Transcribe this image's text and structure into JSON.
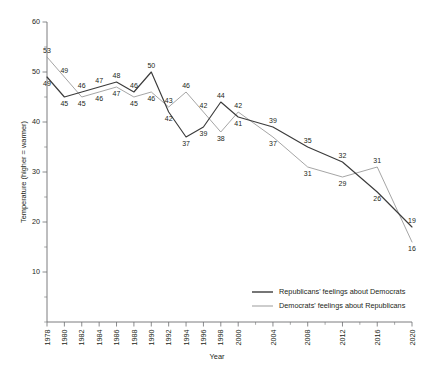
{
  "chart_data": {
    "type": "line",
    "title": "",
    "xlabel": "Year",
    "ylabel": "Temperature (higher = warmer)",
    "ylim": [
      0,
      60
    ],
    "xlim": [
      1978,
      2020
    ],
    "grid": false,
    "legend_position": "bottom-right",
    "y_ticks": [
      10,
      20,
      30,
      40,
      50,
      60
    ],
    "x_ticks": [
      1978,
      1980,
      1982,
      1984,
      1986,
      1988,
      1990,
      1992,
      1994,
      1996,
      1998,
      2000,
      2004,
      2008,
      2012,
      2016,
      2020
    ],
    "x_ticks_all": [
      1978,
      1980,
      1982,
      1984,
      1986,
      1988,
      1990,
      1992,
      1994,
      1996,
      1998,
      2000,
      2002,
      2004,
      2006,
      2008,
      2010,
      2012,
      2014,
      2016,
      2018,
      2020
    ],
    "series": [
      {
        "name": "Republicans' feelings about Democrats",
        "color": "#3b3b3b",
        "x": [
          1978,
          1980,
          1982,
          1984,
          1986,
          1988,
          1990,
          1992,
          1994,
          1996,
          1998,
          2000,
          2004,
          2008,
          2012,
          2016,
          2020
        ],
        "values": [
          49,
          45,
          46,
          47,
          48,
          46,
          50,
          42,
          37,
          39,
          44,
          41,
          39,
          35,
          32,
          26,
          19
        ]
      },
      {
        "name": "Democrats' feelings about Republicans",
        "color": "#9b9b9b",
        "x": [
          1978,
          1980,
          1982,
          1984,
          1986,
          1988,
          1990,
          1992,
          1994,
          1996,
          1998,
          2000,
          2004,
          2008,
          2012,
          2016,
          2020
        ],
        "values": [
          53,
          49,
          45,
          46,
          47,
          45,
          46,
          43,
          46,
          42,
          38,
          42,
          37,
          31,
          29,
          31,
          16
        ]
      }
    ]
  },
  "legend": {
    "items": [
      {
        "label": "Republicans' feelings about Democrats",
        "color": "#3b3b3b"
      },
      {
        "label": "Democrats' feelings about Republicans",
        "color": "#9b9b9b"
      }
    ]
  },
  "axes": {
    "x_title": "Year",
    "y_title": "Temperature (higher = warmer)"
  }
}
